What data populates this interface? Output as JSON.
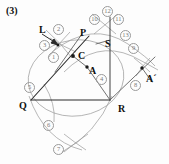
{
  "figure": {
    "caption": "(3)",
    "width": 169,
    "height": 164,
    "background_color": "#fdfdfd",
    "line_color": "#2b2b2b",
    "arc_color": "#8d8d8d",
    "label_color": "#101010",
    "number_color": "#7a7a7a"
  },
  "point_labels": [
    {
      "id": "L",
      "text": "L",
      "x": 39,
      "y": 30
    },
    {
      "id": "P",
      "text": "P",
      "x": 80,
      "y": 33
    },
    {
      "id": "S",
      "text": "S",
      "x": 105,
      "y": 44
    },
    {
      "id": "C",
      "text": "C",
      "x": 79,
      "y": 57
    },
    {
      "id": "A",
      "text": "A",
      "x": 89,
      "y": 70
    },
    {
      "id": "Ap",
      "text": "A´",
      "x": 147,
      "y": 79
    },
    {
      "id": "Q",
      "text": "Q",
      "x": 20,
      "y": 103
    },
    {
      "id": "R",
      "text": "R",
      "x": 119,
      "y": 110
    }
  ],
  "step_numbers": [
    {
      "id": "1",
      "text": "1",
      "x": 52,
      "y": 56
    },
    {
      "id": "2",
      "text": "2",
      "x": 56,
      "y": 28
    },
    {
      "id": "3",
      "text": "3",
      "x": 43,
      "y": 44
    },
    {
      "id": "4",
      "text": "4",
      "x": 100,
      "y": 78
    },
    {
      "id": "5",
      "text": "5",
      "x": 28,
      "y": 86
    },
    {
      "id": "6",
      "text": "6",
      "x": 47,
      "y": 124
    },
    {
      "id": "7",
      "text": "7",
      "x": 57,
      "y": 148
    },
    {
      "id": "8",
      "text": "8",
      "x": 134,
      "y": 84
    },
    {
      "id": "9",
      "text": "9",
      "x": 131,
      "y": 47
    },
    {
      "id": "10",
      "text": "10",
      "x": 93,
      "y": 18
    },
    {
      "id": "11",
      "text": "11",
      "x": 117,
      "y": 18
    },
    {
      "id": "12",
      "text": "12",
      "x": 106,
      "y": 10
    },
    {
      "id": "13",
      "text": "13",
      "x": 124,
      "y": 34
    }
  ],
  "vertices": {
    "Q": {
      "x": 31,
      "y": 100
    },
    "R": {
      "x": 110,
      "y": 100
    },
    "P": {
      "x": 85,
      "y": 40
    },
    "C": {
      "x": 73,
      "y": 56
    },
    "A": {
      "x": 87,
      "y": 67
    },
    "S": {
      "x": 110,
      "y": 40
    },
    "L_arrow_tip": {
      "x": 58,
      "y": 44
    },
    "A_prime": {
      "x": 142,
      "y": 68
    },
    "top_cross": {
      "x": 105,
      "y": 22
    },
    "bottom_cross": {
      "x": 74,
      "y": 143
    }
  },
  "segments": [
    {
      "name": "QR",
      "x1": 31,
      "y1": 100,
      "x2": 110,
      "y2": 100
    },
    {
      "name": "QP",
      "x1": 31,
      "y1": 100,
      "x2": 89,
      "y2": 36
    },
    {
      "name": "RS",
      "x1": 110,
      "y1": 100,
      "x2": 110,
      "y2": 40
    },
    {
      "name": "SUP",
      "x1": 110,
      "y1": 40,
      "x2": 110,
      "y2": 18
    },
    {
      "name": "AR",
      "x1": 87,
      "y1": 67,
      "x2": 110,
      "y2": 100
    },
    {
      "name": "CA",
      "x1": 73,
      "y1": 56,
      "x2": 87,
      "y2": 67
    },
    {
      "name": "RAp",
      "x1": 110,
      "y1": 100,
      "x2": 152,
      "y2": 60
    },
    {
      "name": "L-arrow-shaft",
      "x1": 41,
      "y1": 33,
      "x2": 58,
      "y2": 45
    }
  ],
  "arcs": [
    {
      "name": "big-circle-through-Q-P-R"
    },
    {
      "name": "arc-from-P-to-S-to-Ap"
    },
    {
      "name": "arc-Q-bottom-sweep"
    },
    {
      "name": "arc-R-bottom-sweep"
    },
    {
      "name": "arc-top-left-pair"
    },
    {
      "name": "arc-top-right-pair"
    },
    {
      "name": "arc-A-prime-tick"
    }
  ]
}
